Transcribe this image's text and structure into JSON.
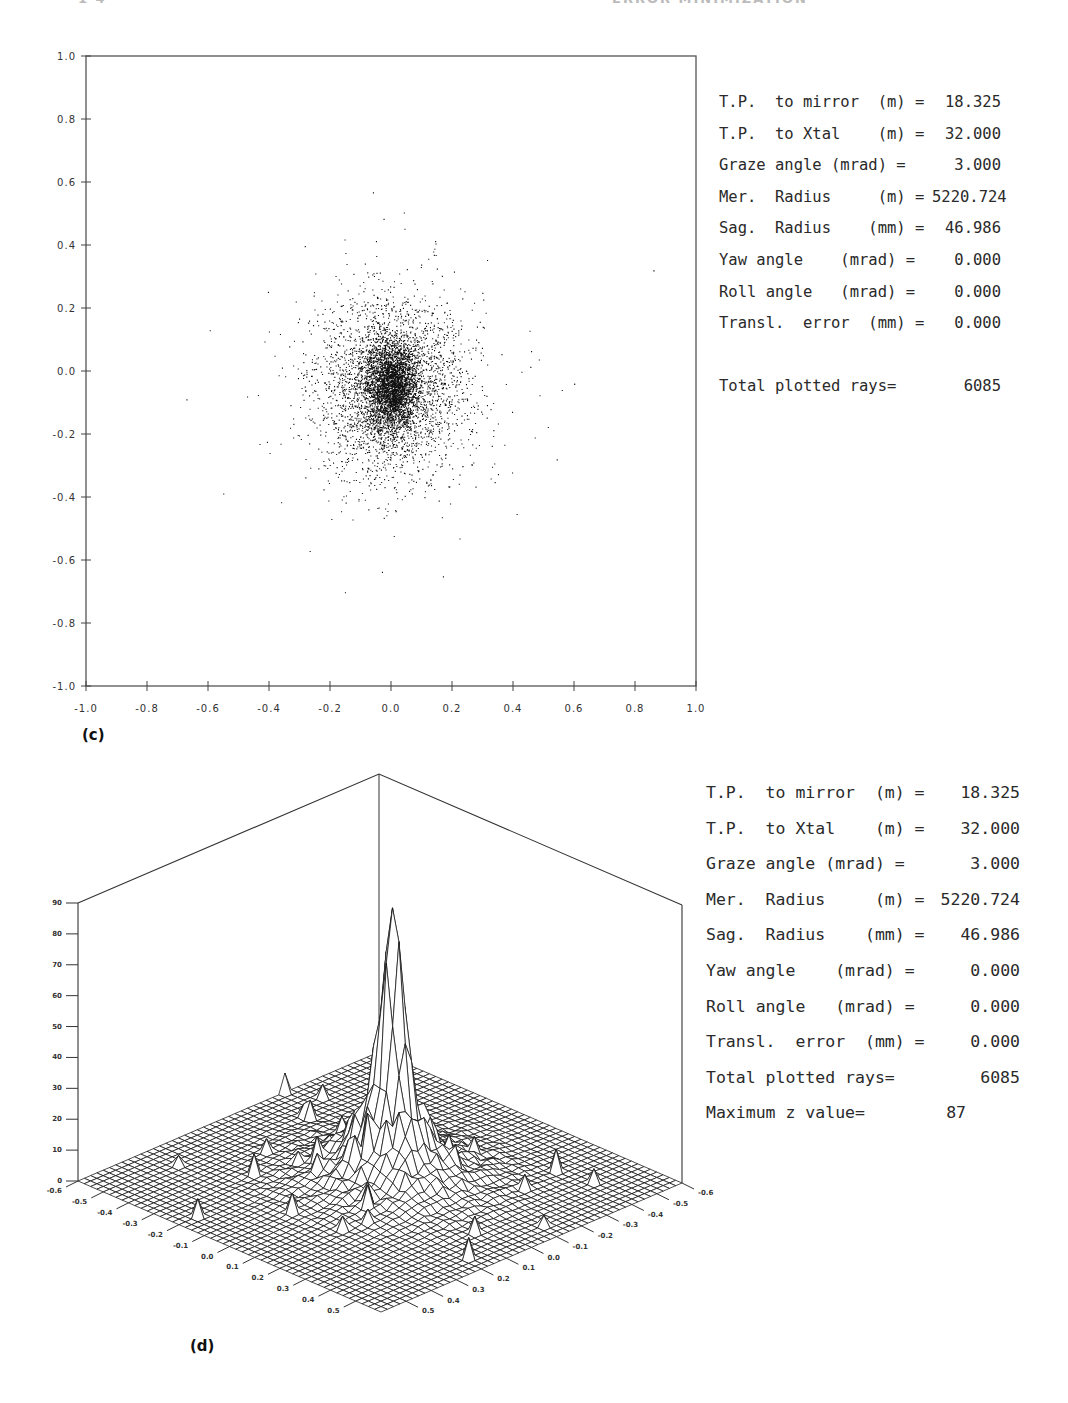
{
  "page_header": {
    "left": "1 4",
    "center": "ERROR MINIMIZATION"
  },
  "panel_c": {
    "label": "(c)",
    "params": [
      {
        "label": "T.P.  to mirror  (m) =",
        "value": "18.325"
      },
      {
        "label": "T.P.  to Xtal    (m) =",
        "value": "32.000"
      },
      {
        "label": "Graze angle (mrad) =",
        "value": "3.000"
      },
      {
        "label": "Mer.  Radius     (m) =",
        "value": "5220.724"
      },
      {
        "label": "Sag.  Radius    (mm) =",
        "value": "46.986"
      },
      {
        "label": "Yaw angle    (mrad) =",
        "value": "0.000"
      },
      {
        "label": "Roll angle   (mrad) =",
        "value": "0.000"
      },
      {
        "label": "Transl.  error  (mm) =",
        "value": "0.000"
      }
    ],
    "total_rays_label": "Total plotted rays=",
    "total_rays_value": "6085"
  },
  "panel_d": {
    "label": "(d)",
    "params": [
      {
        "label": "T.P.  to mirror  (m) =",
        "value": "18.325"
      },
      {
        "label": "T.P.  to Xtal    (m) =",
        "value": "32.000"
      },
      {
        "label": "Graze angle (mrad) =",
        "value": "3.000"
      },
      {
        "label": "Mer.  Radius     (m) =",
        "value": "5220.724"
      },
      {
        "label": "Sag.  Radius    (mm) =",
        "value": "46.986"
      },
      {
        "label": "Yaw angle    (mrad) =",
        "value": "0.000"
      },
      {
        "label": "Roll angle   (mrad) =",
        "value": "0.000"
      },
      {
        "label": "Transl.  error  (mm) =",
        "value": "0.000"
      }
    ],
    "total_rays_label": "Total plotted rays=",
    "total_rays_value": "6085",
    "max_z_label": "Maximum z value=",
    "max_z_value": "87"
  },
  "chart_data": [
    {
      "type": "scatter",
      "title": "(c) Spot diagram",
      "xlabel": "",
      "ylabel": "",
      "xlim": [
        -1.0,
        1.0
      ],
      "ylim": [
        -1.0,
        1.0
      ],
      "x_ticks": [
        "-1.0",
        "-0.8",
        "-0.6",
        "-0.4",
        "-0.2",
        "0.0",
        "0.2",
        "0.4",
        "0.6",
        "0.8",
        "1.0"
      ],
      "y_ticks": [
        "1.0",
        "0.8",
        "0.6",
        "0.4",
        "0.2",
        "0.0",
        "-0.2",
        "-0.4",
        "-0.6",
        "-0.8",
        "-1.0"
      ],
      "grid": false,
      "n_points": 6085,
      "distribution": {
        "center": [
          0.0,
          -0.05
        ],
        "core_sigma": [
          0.04,
          0.07
        ],
        "halo_sigma": [
          0.12,
          0.14
        ],
        "extent_approx": {
          "x": [
            -0.5,
            0.87
          ],
          "y": [
            -0.63,
            0.5
          ]
        }
      }
    },
    {
      "type": "surface3d",
      "title": "(d) Ray density histogram",
      "zlabel": "",
      "z_ticks": [
        "0",
        "10",
        "20",
        "30",
        "40",
        "50",
        "60",
        "70",
        "80",
        "90"
      ],
      "zlim": [
        0,
        90
      ],
      "x_ticks": [
        "-0.6",
        "-0.5",
        "-0.4",
        "-0.3",
        "-0.2",
        "-0.1",
        "0.0",
        "0.1",
        "0.2",
        "0.3",
        "0.4",
        "0.5"
      ],
      "y_ticks": [
        "-0.6",
        "-0.5",
        "-0.4",
        "-0.3",
        "-0.2",
        "-0.1",
        "0.0",
        "0.1",
        "0.2",
        "0.3",
        "0.4",
        "0.5"
      ],
      "xlim": [
        -0.6,
        0.6
      ],
      "ylim": [
        -0.6,
        0.6
      ],
      "grid_cells": 48,
      "max_z": 87,
      "peak_location": [
        0.0,
        -0.05
      ]
    }
  ],
  "colors": {
    "ink": "#1a1a1a",
    "axis": "#444444",
    "paper": "#ffffff"
  }
}
